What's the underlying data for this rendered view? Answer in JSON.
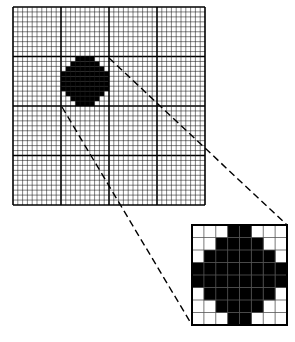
{
  "figure": {
    "colors": {
      "background": "#ffffff",
      "ink": "#000000",
      "fine_grid": "#1a1a1a",
      "major_grid": "#000000"
    },
    "main_grid": {
      "x": 13,
      "y": 7,
      "width": 192,
      "height": 198,
      "major_divisions": 4,
      "minor_per_major": 10,
      "diamond": {
        "col_start": 10,
        "row_start": 10,
        "rows": [
          [
            3,
            6
          ],
          [
            2,
            7
          ],
          [
            1,
            8
          ],
          [
            0,
            9
          ],
          [
            0,
            9
          ],
          [
            0,
            9
          ],
          [
            0,
            9
          ],
          [
            1,
            8
          ],
          [
            2,
            7
          ],
          [
            3,
            6
          ]
        ]
      }
    },
    "inset": {
      "x": 192,
      "y": 225,
      "width": 95,
      "height": 100,
      "cells": 8,
      "pattern": [
        [
          0,
          0,
          0,
          1,
          1,
          0,
          0,
          0
        ],
        [
          0,
          0,
          1,
          1,
          1,
          1,
          0,
          0
        ],
        [
          0,
          1,
          1,
          1,
          1,
          1,
          1,
          0
        ],
        [
          1,
          1,
          1,
          1,
          1,
          1,
          1,
          1
        ],
        [
          1,
          1,
          1,
          1,
          1,
          1,
          1,
          1
        ],
        [
          0,
          1,
          1,
          1,
          1,
          1,
          1,
          0
        ],
        [
          0,
          0,
          1,
          1,
          1,
          1,
          0,
          0
        ],
        [
          0,
          0,
          0,
          1,
          1,
          0,
          0,
          0
        ]
      ]
    },
    "projection_lines": [
      {
        "name": "upper",
        "x1": 109,
        "y1": 58,
        "x2": 287,
        "y2": 225
      },
      {
        "name": "lower",
        "x1": 62,
        "y1": 107,
        "x2": 192,
        "y2": 325
      }
    ]
  }
}
